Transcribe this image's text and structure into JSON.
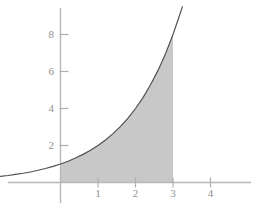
{
  "chart_data": {
    "type": "area",
    "title": "",
    "subtitle": "",
    "xlabel": "",
    "ylabel": "",
    "function_label": "y = 2^x",
    "curve": {
      "name": "exponential curve",
      "x": [
        -1.6,
        -1.4,
        -1.2,
        -1.0,
        -0.8,
        -0.6,
        -0.4,
        -0.2,
        0.0,
        0.2,
        0.4,
        0.6,
        0.8,
        1.0,
        1.2,
        1.4,
        1.6,
        1.8,
        2.0,
        2.2,
        2.4,
        2.6,
        2.8,
        3.0,
        3.2,
        3.25
      ],
      "y": [
        0.33,
        0.38,
        0.44,
        0.5,
        0.57,
        0.66,
        0.76,
        0.87,
        1.0,
        1.15,
        1.32,
        1.52,
        1.74,
        2.0,
        2.3,
        2.64,
        3.03,
        3.48,
        4.0,
        4.59,
        5.28,
        6.06,
        6.96,
        8.0,
        9.19,
        9.51
      ]
    },
    "shaded_region": {
      "label": "area under curve",
      "x_start": 0,
      "x_end": 3,
      "y_start": 0,
      "fill_color": "#c8c8c8"
    },
    "x_ticks": [
      {
        "value": 1,
        "label": "1"
      },
      {
        "value": 2,
        "label": "2"
      },
      {
        "value": 3,
        "label": "3"
      },
      {
        "value": 4,
        "label": "4"
      }
    ],
    "y_ticks": [
      {
        "value": 2,
        "label": "2"
      },
      {
        "value": 4,
        "label": "4"
      },
      {
        "value": 6,
        "label": "6"
      },
      {
        "value": 8,
        "label": "8"
      }
    ],
    "xlim": [
      -1.6,
      5.3
    ],
    "ylim": [
      -0.35,
      9.6
    ],
    "grid": false,
    "legend": null,
    "colors": {
      "background": "#ffffff",
      "axis": "#b0b0b0",
      "tick_text": "#8f8f8f",
      "curve": "#4f4f4f",
      "fill": "#c8c8c8"
    }
  }
}
